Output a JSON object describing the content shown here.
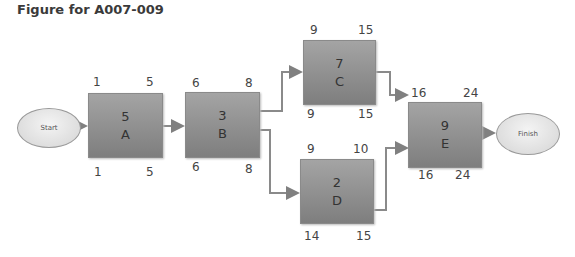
{
  "title": "Figure for A007-009",
  "start_label": "Start",
  "finish_label": "Finish",
  "nodes": {
    "A": {
      "duration": "5",
      "name": "A",
      "es": "1",
      "ef": "5",
      "ls": "1",
      "lf": "5"
    },
    "B": {
      "duration": "3",
      "name": "B",
      "es": "6",
      "ef": "8",
      "ls": "6",
      "lf": "8"
    },
    "C": {
      "duration": "7",
      "name": "C",
      "es": "9",
      "ef": "15",
      "ls": "9",
      "lf": "15"
    },
    "D": {
      "duration": "2",
      "name": "D",
      "es": "9",
      "ef": "10",
      "ls": "14",
      "lf": "15"
    },
    "E": {
      "duration": "9",
      "name": "E",
      "es": "16",
      "ef": "24",
      "ls": "16",
      "lf": "24"
    }
  },
  "edges": [
    [
      "Start",
      "A"
    ],
    [
      "A",
      "B"
    ],
    [
      "B",
      "C"
    ],
    [
      "B",
      "D"
    ],
    [
      "C",
      "E"
    ],
    [
      "D",
      "E"
    ],
    [
      "E",
      "Finish"
    ]
  ]
}
